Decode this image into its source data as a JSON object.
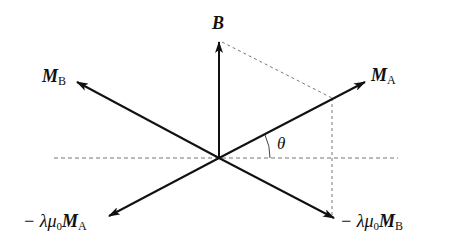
{
  "diagram": {
    "origin": [
      219,
      158
    ],
    "colors": {
      "arrow": "#111111",
      "dashed": "#777777",
      "background": "#ffffff"
    },
    "labels": {
      "B": {
        "main": "B"
      },
      "MA": {
        "main": "M",
        "sub": "A"
      },
      "MB": {
        "main": "M",
        "sub": "B"
      },
      "neg_MA": {
        "prefix": "− λμ",
        "zero": "0",
        "main": "M",
        "sub": "A"
      },
      "neg_MB": {
        "prefix": "− λμ",
        "zero": "0",
        "main": "M",
        "sub": "B"
      },
      "theta": "θ"
    },
    "vectors": [
      {
        "name": "B",
        "to": [
          219,
          42
        ]
      },
      {
        "name": "M_A",
        "to": [
          365,
          82
        ]
      },
      {
        "name": "M_B",
        "to": [
          77,
          82
        ]
      },
      {
        "name": "-lambda mu0 M_A",
        "to": [
          109,
          216
        ]
      },
      {
        "name": "-lambda mu0 M_B",
        "to": [
          334,
          218
        ]
      }
    ]
  }
}
